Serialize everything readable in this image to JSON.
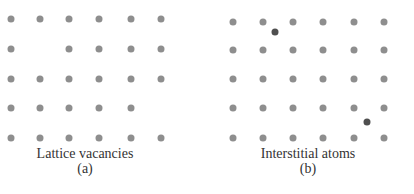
{
  "colors": {
    "lattice_atom": "#8e8e8e",
    "interstitial_atom": "#4f4f4f",
    "text": "#333333"
  },
  "panels": [
    {
      "id": "a",
      "caption": "Lattice vacancies",
      "label": "(a)",
      "caption_x": 85,
      "columns_x": [
        11,
        40,
        69,
        99,
        131,
        161
      ],
      "rows_y": [
        19,
        49,
        79,
        108,
        138
      ],
      "vacancies": [
        [
          1,
          1
        ],
        [
          3,
          5
        ]
      ],
      "interstitials": []
    },
    {
      "id": "b",
      "caption": "Interstitial atoms",
      "label": "(b)",
      "caption_x": 308,
      "columns_x": [
        233,
        263,
        293,
        323,
        354,
        384
      ],
      "rows_y": [
        22,
        50,
        79,
        108,
        138
      ],
      "vacancies": [],
      "interstitials": [
        [
          275,
          32
        ],
        [
          367,
          122
        ]
      ]
    }
  ]
}
